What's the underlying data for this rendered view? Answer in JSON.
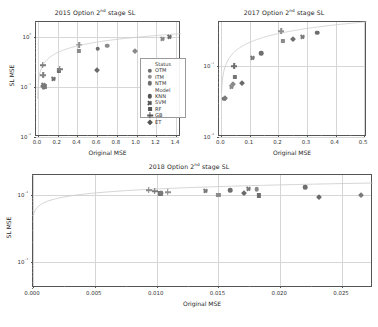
{
  "figure": {
    "background": "#ffffff",
    "marker_palette": {
      "OTM": "#6e6e6e",
      "ITM": "#8f8f8f",
      "NTM": "#707070",
      "dark": "#4d4d4d",
      "mid": "#7a7a7a",
      "light": "#9d9d9d"
    },
    "fit_line_color": "#c9c9c9",
    "grid_color": "#d6d6d6"
  },
  "legend": {
    "title_status": "Status",
    "title_model": "Model",
    "status_items": [
      {
        "label": "OTM",
        "marker": "circle",
        "color": "#6e6e6e"
      },
      {
        "label": "ITM",
        "marker": "circle",
        "color": "#8f8f8f"
      },
      {
        "label": "NTM",
        "marker": "circle",
        "color": "#707070"
      }
    ],
    "model_items": [
      {
        "label": "KNN",
        "marker": "circle",
        "color": "#555555"
      },
      {
        "label": "SVM",
        "marker": "x",
        "color": "#555555"
      },
      {
        "label": "RF",
        "marker": "square",
        "color": "#555555"
      },
      {
        "label": "GB",
        "marker": "plus",
        "color": "#555555"
      },
      {
        "label": "ET",
        "marker": "diamond",
        "color": "#555555"
      }
    ]
  },
  "chart_data": [
    {
      "id": "plot-2015",
      "type": "scatter",
      "title": "2015 Option 2nd stage SL",
      "title_prefix": "2015 Option 2",
      "title_sup": "nd",
      "title_suffix": " stage SL",
      "xlabel": "Original MSE",
      "ylabel": "SL MSE",
      "xscale": "linear",
      "yscale": "log",
      "xlim": [
        -0.02,
        1.45
      ],
      "ylim": [
        0.01,
        2.0
      ],
      "xticks": [
        0.0,
        0.2,
        0.4,
        0.6,
        0.8,
        1.0,
        1.2,
        1.4
      ],
      "xticklabels": [
        "0.0",
        "0.2",
        "0.4",
        "0.6",
        "0.8",
        "1.0",
        "1.2",
        "1.4"
      ],
      "yticks": [
        0.01,
        0.1,
        1.0
      ],
      "yticklabels": [
        "10⁻²",
        "10⁻¹",
        "10⁰"
      ],
      "grid": true,
      "has_legend": true,
      "fit_curve": {
        "kind": "log-saturating",
        "color": "#c9c9c9"
      },
      "points": [
        {
          "x": 0.055,
          "y": 0.105,
          "marker": "diamond",
          "color": "#6e6e6e"
        },
        {
          "x": 0.06,
          "y": 0.098,
          "marker": "circle",
          "color": "#8f8f8f"
        },
        {
          "x": 0.065,
          "y": 0.103,
          "marker": "square",
          "color": "#7a7a7a"
        },
        {
          "x": 0.058,
          "y": 0.112,
          "marker": "x",
          "color": "#7a7a7a"
        },
        {
          "x": 0.05,
          "y": 0.175,
          "marker": "plus",
          "color": "#808080"
        },
        {
          "x": 0.048,
          "y": 0.275,
          "marker": "plus",
          "color": "#7a7a7a"
        },
        {
          "x": 0.155,
          "y": 0.148,
          "marker": "x",
          "color": "#6e6e6e"
        },
        {
          "x": 0.215,
          "y": 0.215,
          "marker": "square",
          "color": "#6b6b6b"
        },
        {
          "x": 0.22,
          "y": 0.228,
          "marker": "plus",
          "color": "#828282"
        },
        {
          "x": 0.415,
          "y": 0.52,
          "marker": "square",
          "color": "#8a8a8a"
        },
        {
          "x": 0.42,
          "y": 0.7,
          "marker": "plus",
          "color": "#8f8f8f"
        },
        {
          "x": 0.605,
          "y": 0.585,
          "marker": "circle",
          "color": "#6e6e6e"
        },
        {
          "x": 0.6,
          "y": 0.215,
          "marker": "diamond",
          "color": "#6a6a6a"
        },
        {
          "x": 0.7,
          "y": 0.665,
          "marker": "circle",
          "color": "#8b8b8b"
        },
        {
          "x": 0.985,
          "y": 0.52,
          "marker": "diamond",
          "color": "#888888"
        },
        {
          "x": 1.26,
          "y": 0.93,
          "marker": "x",
          "color": "#8a8a8a"
        },
        {
          "x": 1.33,
          "y": 0.98,
          "marker": "x",
          "color": "#6e6e6e"
        }
      ]
    },
    {
      "id": "plot-2017",
      "type": "scatter",
      "title": "2017 Option 2nd stage SL",
      "title_prefix": "2017 Option 2",
      "title_sup": "nd",
      "title_suffix": " stage SL",
      "xlabel": "Original MSE",
      "ylabel": "",
      "xscale": "linear",
      "yscale": "log",
      "xlim": [
        -0.008,
        0.51
      ],
      "ylim": [
        0.01,
        0.42
      ],
      "xticks": [
        0.0,
        0.1,
        0.2,
        0.3,
        0.4,
        0.5
      ],
      "xticklabels": [
        "0.0",
        "0.1",
        "0.2",
        "0.3",
        "0.4",
        "0.5"
      ],
      "yticks": [
        0.01,
        0.1
      ],
      "yticklabels": [
        "10⁻²",
        "10⁻¹"
      ],
      "grid": true,
      "has_legend": false,
      "fit_curve": {
        "kind": "log-saturating",
        "color": "#c9c9c9"
      },
      "points": [
        {
          "x": 0.011,
          "y": 0.0345,
          "marker": "circle",
          "color": "#6e6e6e"
        },
        {
          "x": 0.014,
          "y": 0.0355,
          "marker": "diamond",
          "color": "#7a7a7a"
        },
        {
          "x": 0.035,
          "y": 0.0505,
          "marker": "x",
          "color": "#8a8a8a"
        },
        {
          "x": 0.04,
          "y": 0.056,
          "marker": "diamond",
          "color": "#8a8a8a"
        },
        {
          "x": 0.047,
          "y": 0.07,
          "marker": "square",
          "color": "#757575"
        },
        {
          "x": 0.044,
          "y": 0.101,
          "marker": "plus",
          "color": "#6e6e6e"
        },
        {
          "x": 0.072,
          "y": 0.057,
          "marker": "diamond",
          "color": "#6a6a6a"
        },
        {
          "x": 0.11,
          "y": 0.129,
          "marker": "x",
          "color": "#7a7a7a"
        },
        {
          "x": 0.14,
          "y": 0.152,
          "marker": "circle",
          "color": "#6e6e6e"
        },
        {
          "x": 0.215,
          "y": 0.23,
          "marker": "square",
          "color": "#8a8a8a"
        },
        {
          "x": 0.21,
          "y": 0.31,
          "marker": "plus",
          "color": "#8f8f8f"
        },
        {
          "x": 0.25,
          "y": 0.245,
          "marker": "diamond",
          "color": "#6e6e6e"
        },
        {
          "x": 0.285,
          "y": 0.26,
          "marker": "x",
          "color": "#7a7a7a"
        },
        {
          "x": 0.335,
          "y": 0.295,
          "marker": "circle",
          "color": "#6e6e6e"
        }
      ]
    },
    {
      "id": "plot-2018",
      "type": "scatter",
      "title": "2018 Option 2nd stage SL",
      "title_prefix": "2018 Option 2",
      "title_sup": "nd",
      "title_suffix": " stage SL",
      "xlabel": "Original MSE",
      "ylabel": "SL MSE",
      "xscale": "linear",
      "yscale": "log",
      "xlim": [
        0.0,
        0.0275
      ],
      "ylim": [
        0.0004,
        0.02
      ],
      "xticks": [
        0.0,
        0.005,
        0.01,
        0.015,
        0.02,
        0.025
      ],
      "xticklabels": [
        "0.000",
        "0.005",
        "0.010",
        "0.015",
        "0.020",
        "0.025"
      ],
      "yticks": [
        0.001,
        0.01
      ],
      "yticklabels": [
        "10⁻³",
        "10⁻²"
      ],
      "grid": true,
      "has_legend": false,
      "fit_curve": {
        "kind": "log-saturating",
        "color": "#c9c9c9"
      },
      "points": [
        {
          "x": 0.00935,
          "y": 0.0118,
          "marker": "plus",
          "color": "#8a8a8a"
        },
        {
          "x": 0.00985,
          "y": 0.0113,
          "marker": "plus",
          "color": "#7a7a7a"
        },
        {
          "x": 0.0103,
          "y": 0.0106,
          "marker": "square",
          "color": "#6e6e6e"
        },
        {
          "x": 0.01035,
          "y": 0.0108,
          "marker": "diamond",
          "color": "#7a7a7a"
        },
        {
          "x": 0.0109,
          "y": 0.0111,
          "marker": "plus",
          "color": "#8f8f8f"
        },
        {
          "x": 0.01395,
          "y": 0.0113,
          "marker": "x",
          "color": "#7a7a7a"
        },
        {
          "x": 0.015,
          "y": 0.0101,
          "marker": "square",
          "color": "#8a8a8a"
        },
        {
          "x": 0.01595,
          "y": 0.0118,
          "marker": "circle",
          "color": "#6e6e6e"
        },
        {
          "x": 0.01705,
          "y": 0.0109,
          "marker": "diamond",
          "color": "#6a6a6a"
        },
        {
          "x": 0.01745,
          "y": 0.0124,
          "marker": "x",
          "color": "#7a7a7a"
        },
        {
          "x": 0.0181,
          "y": 0.0122,
          "marker": "circle",
          "color": "#8a8a8a"
        },
        {
          "x": 0.01825,
          "y": 0.00985,
          "marker": "square",
          "color": "#6e6e6e"
        },
        {
          "x": 0.022,
          "y": 0.0131,
          "marker": "circle",
          "color": "#6e6e6e"
        },
        {
          "x": 0.0231,
          "y": 0.0093,
          "marker": "diamond",
          "color": "#6a6a6a"
        },
        {
          "x": 0.0265,
          "y": 0.01,
          "marker": "diamond",
          "color": "#7a7a7a"
        }
      ]
    }
  ]
}
